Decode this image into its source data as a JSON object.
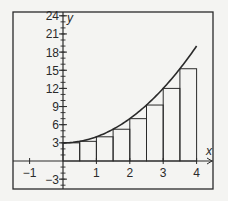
{
  "chart_data": {
    "type": "bar",
    "title": "",
    "xlabel": "x",
    "ylabel": "y",
    "xlim": [
      -1.5,
      4.5
    ],
    "ylim": [
      -4.6,
      24.6
    ],
    "grid": false,
    "legend": null,
    "x_ticks": [
      -1,
      1,
      2,
      3,
      4
    ],
    "x_tick_labels": [
      "−1",
      "1",
      "2",
      "3",
      "4"
    ],
    "y_ticks": [
      -3,
      3,
      6,
      9,
      12,
      15,
      18,
      21,
      24
    ],
    "y_tick_labels": [
      "−3",
      "3",
      "6",
      "9",
      "12",
      "15",
      "18",
      "21",
      "24"
    ],
    "y_minor_tick_step": 1,
    "curve": {
      "description": "y = x^2 + 3",
      "x_range": [
        0,
        4
      ],
      "endpoints": [
        [
          0,
          3
        ],
        [
          4,
          19
        ]
      ]
    },
    "rectangles": {
      "description": "Left-endpoint Riemann sum rectangles, width 0.5",
      "width": 0.5,
      "x_left": [
        0,
        0.5,
        1,
        1.5,
        2,
        2.5,
        3,
        3.5
      ],
      "heights": [
        3,
        3.25,
        4,
        5.25,
        7,
        9.25,
        12,
        15.25
      ]
    }
  },
  "colors": {
    "background": "#f4f4f2",
    "ink": "#2a2a2a"
  }
}
